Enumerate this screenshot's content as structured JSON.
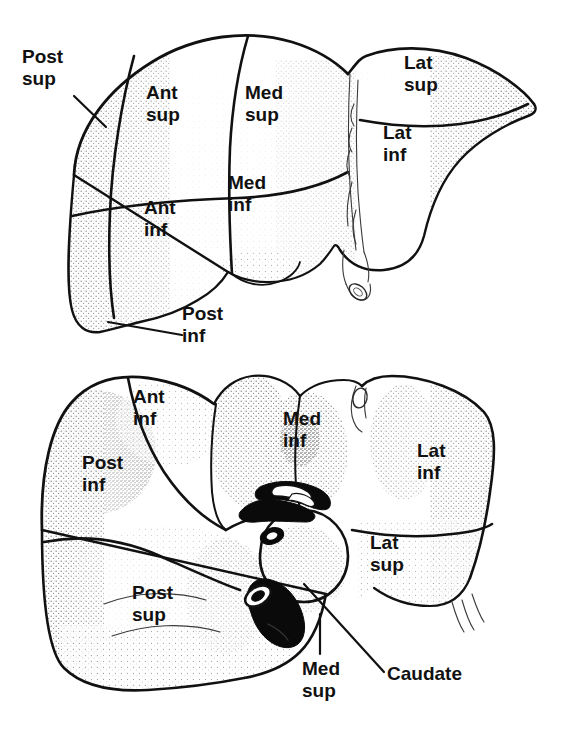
{
  "figure": {
    "views": [
      {
        "name": "anterior-view",
        "description": "Anterior (diaphragmatic) surface of the liver with segment labels"
      },
      {
        "name": "inferior-view",
        "description": "Inferior (visceral) surface of the liver with segment labels"
      }
    ],
    "ink_color": "#111111",
    "background_color": "#ffffff"
  },
  "top_view": {
    "labels": [
      {
        "id": "post-sup",
        "text": "Post\nsup",
        "x": 22,
        "y": 46,
        "leader": true
      },
      {
        "id": "ant-sup",
        "text": "Ant\nsup",
        "x": 146,
        "y": 82,
        "leader": false
      },
      {
        "id": "med-sup",
        "text": "Med\nsup",
        "x": 245,
        "y": 82,
        "leader": false
      },
      {
        "id": "lat-sup",
        "text": "Lat\nsup",
        "x": 404,
        "y": 52,
        "leader": false
      },
      {
        "id": "lat-inf",
        "text": "Lat\ninf",
        "x": 383,
        "y": 122,
        "leader": false
      },
      {
        "id": "med-inf",
        "text": "Med\ninf",
        "x": 228,
        "y": 172,
        "leader": false
      },
      {
        "id": "ant-inf",
        "text": "Ant\ninf",
        "x": 144,
        "y": 197,
        "leader": false
      },
      {
        "id": "post-inf",
        "text": "Post\ninf",
        "x": 182,
        "y": 303,
        "leader": true
      }
    ]
  },
  "bottom_view": {
    "labels": [
      {
        "id": "ant-inf",
        "text": "Ant\ninf",
        "x": 133,
        "y": 386,
        "leader": false
      },
      {
        "id": "med-inf",
        "text": "Med\ninf",
        "x": 283,
        "y": 408,
        "leader": false
      },
      {
        "id": "lat-inf",
        "text": "Lat\ninf",
        "x": 417,
        "y": 440,
        "leader": false
      },
      {
        "id": "post-inf",
        "text": "Post\ninf",
        "x": 82,
        "y": 452,
        "leader": false
      },
      {
        "id": "lat-sup",
        "text": "Lat\nsup",
        "x": 370,
        "y": 532,
        "leader": false
      },
      {
        "id": "post-sup",
        "text": "Post\nsup",
        "x": 132,
        "y": 582,
        "leader": false
      },
      {
        "id": "med-sup",
        "text": "Med\nsup",
        "x": 302,
        "y": 658,
        "leader": true
      },
      {
        "id": "caudate",
        "text": "Caudate",
        "x": 387,
        "y": 663,
        "leader": true
      }
    ]
  }
}
